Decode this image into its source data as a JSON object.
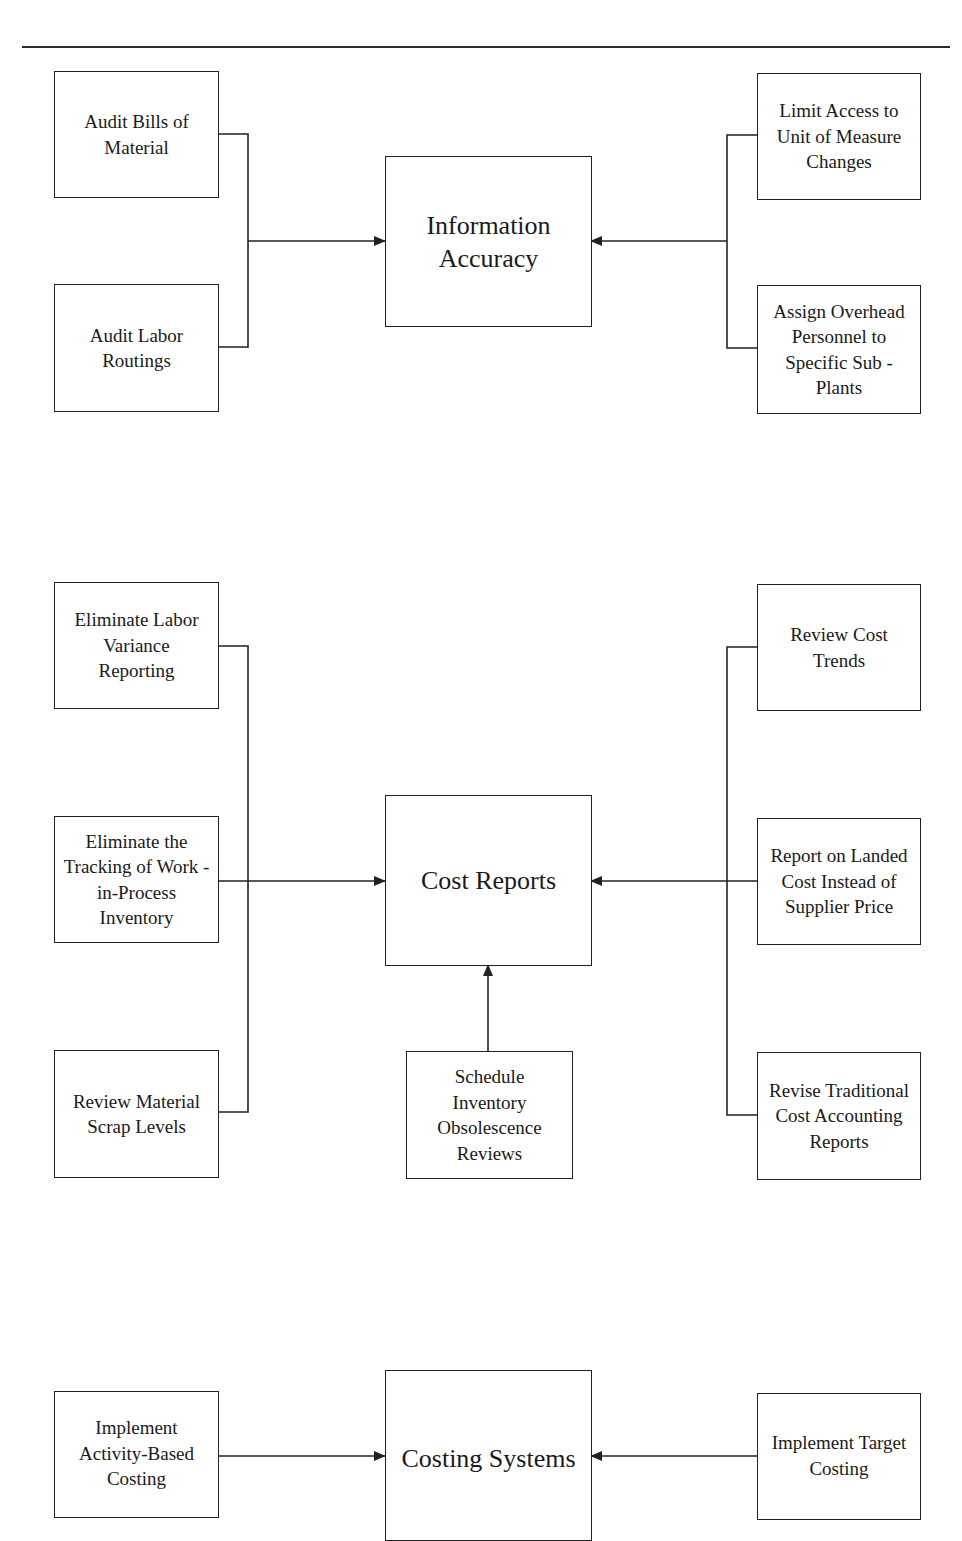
{
  "page": {
    "header_fragment": "",
    "colors": {
      "line": "#222222",
      "background": "#ffffff",
      "text": "#1a1a1a"
    }
  },
  "sections": {
    "information_accuracy": {
      "center": "Information\nAccuracy",
      "left": [
        "Audit Bills of\nMaterial",
        "Audit Labor\nRoutings"
      ],
      "right": [
        "Limit Access to\nUnit of Measure\nChanges",
        "Assign Overhead\nPersonnel to\nSpecific Sub -\nPlants"
      ]
    },
    "cost_reports": {
      "center": "Cost Reports",
      "left": [
        "Eliminate Labor\nVariance\nReporting",
        "Eliminate the\nTracking of Work -\nin-Process\nInventory",
        "Review Material\nScrap Levels"
      ],
      "bottom": "Schedule\nInventory\nObsolescence\nReviews",
      "right": [
        "Review Cost\nTrends",
        "Report on Landed\nCost Instead of\nSupplier Price",
        "Revise Traditional\nCost Accounting\nReports"
      ]
    },
    "costing_systems": {
      "center": "Costing Systems",
      "left": [
        "Implement\nActivity-Based\nCosting"
      ],
      "right": [
        "Implement Target\nCosting"
      ]
    }
  }
}
